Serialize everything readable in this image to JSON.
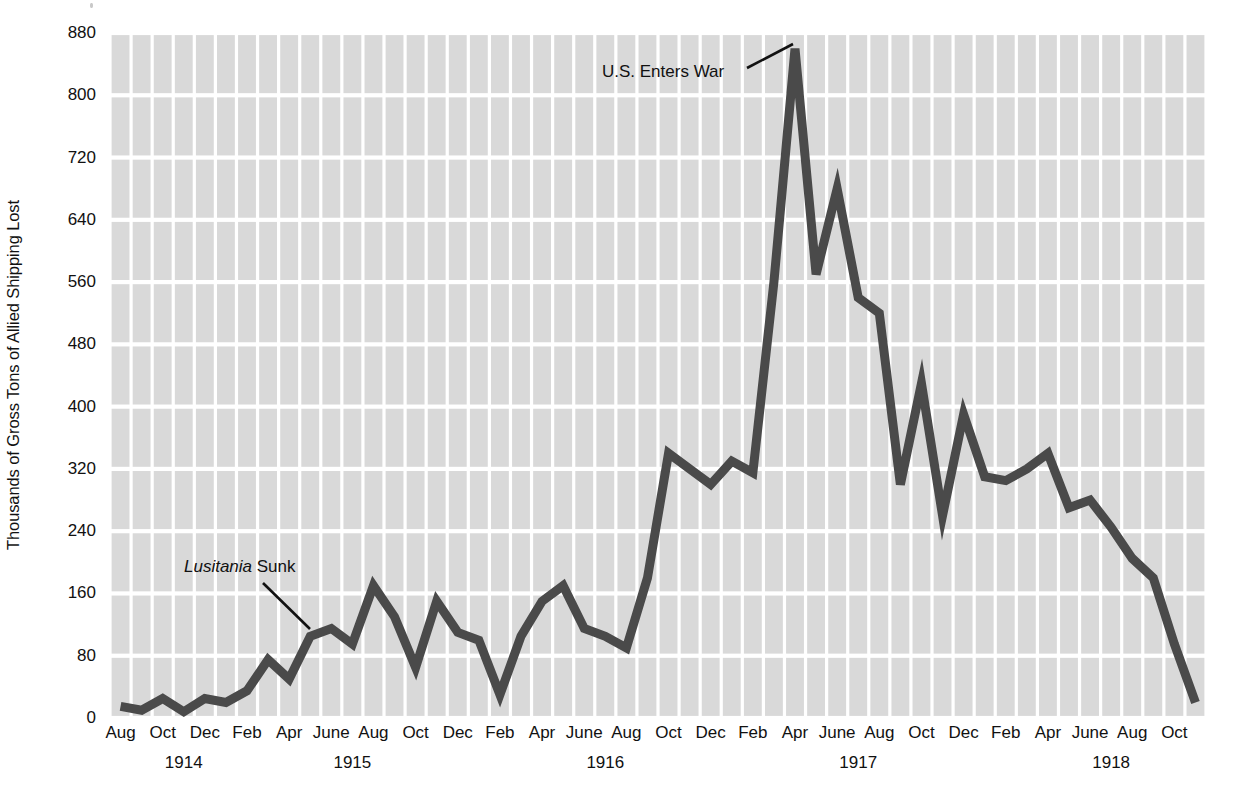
{
  "chart_data": {
    "type": "line",
    "title": "",
    "xlabel": "",
    "ylabel": "Thousands of Gross Tons of Allied Shipping Lost",
    "ylim": [
      0,
      880
    ],
    "yticks": [
      0,
      80,
      160,
      240,
      320,
      400,
      480,
      560,
      640,
      720,
      800,
      880
    ],
    "ytick_labels": [
      "0",
      "80",
      "160",
      "240",
      "320",
      "400",
      "480",
      "560",
      "640",
      "720",
      "800",
      "880"
    ],
    "grid": "blocked-gray-panels-with-white-gridlines",
    "legend": "none",
    "x_tick_labels": [
      {
        "label": "Aug",
        "index": 0
      },
      {
        "label": "Oct",
        "index": 2
      },
      {
        "label": "Dec",
        "index": 4
      },
      {
        "label": "Feb",
        "index": 6
      },
      {
        "label": "Apr",
        "index": 8
      },
      {
        "label": "June",
        "index": 10
      },
      {
        "label": "Aug",
        "index": 12
      },
      {
        "label": "Oct",
        "index": 14
      },
      {
        "label": "Dec",
        "index": 16
      },
      {
        "label": "Feb",
        "index": 18
      },
      {
        "label": "Apr",
        "index": 20
      },
      {
        "label": "June",
        "index": 22
      },
      {
        "label": "Aug",
        "index": 24
      },
      {
        "label": "Oct",
        "index": 26
      },
      {
        "label": "Dec",
        "index": 28
      },
      {
        "label": "Feb",
        "index": 30
      },
      {
        "label": "Apr",
        "index": 32
      },
      {
        "label": "June",
        "index": 34
      },
      {
        "label": "Aug",
        "index": 36
      },
      {
        "label": "Oct",
        "index": 38
      },
      {
        "label": "Dec",
        "index": 40
      },
      {
        "label": "Feb",
        "index": 42
      },
      {
        "label": "Apr",
        "index": 44
      },
      {
        "label": "June",
        "index": 46
      },
      {
        "label": "Aug",
        "index": 48
      },
      {
        "label": "Oct",
        "index": 50
      }
    ],
    "x_year_labels": [
      {
        "label": "1914",
        "index": 3
      },
      {
        "label": "1915",
        "index": 11
      },
      {
        "label": "1916",
        "index": 23
      },
      {
        "label": "1917",
        "index": 35
      },
      {
        "label": "1918",
        "index": 47
      }
    ],
    "x": [
      "Aug 1914",
      "Sep 1914",
      "Oct 1914",
      "Nov 1914",
      "Dec 1914",
      "Jan 1915",
      "Feb 1915",
      "Mar 1915",
      "Apr 1915",
      "May 1915",
      "June 1915",
      "July 1915",
      "Aug 1915",
      "Sep 1915",
      "Oct 1915",
      "Nov 1915",
      "Dec 1915",
      "Jan 1916",
      "Feb 1916",
      "Mar 1916",
      "Apr 1916",
      "May 1916",
      "June 1916",
      "July 1916",
      "Aug 1916",
      "Sep 1916",
      "Oct 1916",
      "Nov 1916",
      "Dec 1916",
      "Jan 1917",
      "Feb 1917",
      "Mar 1917",
      "Apr 1917",
      "May 1917",
      "June 1917",
      "July 1917",
      "Aug 1917",
      "Sep 1917",
      "Oct 1917",
      "Nov 1917",
      "Dec 1917",
      "Jan 1918",
      "Feb 1918",
      "Mar 1918",
      "Apr 1918",
      "May 1918",
      "June 1918",
      "July 1918",
      "Aug 1918",
      "Sep 1918",
      "Oct 1918",
      "Nov 1918"
    ],
    "values": [
      15,
      10,
      25,
      8,
      25,
      20,
      35,
      75,
      50,
      105,
      115,
      95,
      170,
      130,
      65,
      150,
      110,
      100,
      30,
      105,
      150,
      170,
      115,
      105,
      90,
      180,
      340,
      320,
      300,
      330,
      315,
      560,
      860,
      570,
      680,
      540,
      520,
      300,
      430,
      260,
      390,
      310,
      305,
      320,
      340,
      270,
      280,
      245,
      205,
      180,
      95,
      20
    ],
    "line_color": "#4a4a4a",
    "line_width_px": 9,
    "annotations": [
      {
        "id": "lusitania",
        "text_italic": "Lusitania",
        "text_plain": " Sunk",
        "label_x_px": 184,
        "label_y_px": 557,
        "leader_from": [
          263,
          583
        ],
        "leader_to": [
          310,
          629
        ]
      },
      {
        "id": "us-enters-war",
        "text_italic": "",
        "text_plain": "U.S. Enters War",
        "label_x_px": 602,
        "label_y_px": 62,
        "leader_from": [
          747,
          68
        ],
        "leader_to": [
          793,
          44
        ]
      }
    ]
  },
  "colors": {
    "panel_gray": "#d9d9d9",
    "gridline_white": "#ffffff",
    "line": "#4a4a4a",
    "text": "#111111",
    "background": "#ffffff"
  }
}
